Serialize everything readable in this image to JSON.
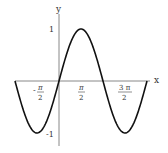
{
  "chart_data": {
    "type": "line",
    "title": "",
    "function": "sin(x)",
    "xlabel": "x",
    "ylabel": "y",
    "xlim": [
      -3.1416,
      6.2832
    ],
    "ylim": [
      -1,
      1
    ],
    "grid": false,
    "legend": null,
    "x_ticks": [
      {
        "value": -1.5708,
        "num": "π",
        "den": "2",
        "sign": "-"
      },
      {
        "value": 1.5708,
        "num": "π",
        "den": "2",
        "sign": ""
      },
      {
        "value": 4.7124,
        "num": "3 π",
        "den": "2",
        "sign": ""
      }
    ],
    "y_ticks": [
      {
        "value": 1,
        "label": "1"
      },
      {
        "value": -1,
        "label": "-1"
      }
    ],
    "series": [
      {
        "name": "sin(x)",
        "x": [
          -3.1416,
          -2.3562,
          -1.5708,
          -0.7854,
          0,
          0.7854,
          1.5708,
          2.3562,
          3.1416,
          3.927,
          4.7124,
          5.4978,
          6.2832
        ],
        "y": [
          0,
          -0.7071,
          -1,
          -0.7071,
          0,
          0.7071,
          1,
          0.7071,
          0,
          -0.7071,
          -1,
          -0.7071,
          0
        ]
      }
    ]
  },
  "axes": {
    "x_label": "x",
    "y_label": "y",
    "tick_1": "1",
    "tick_neg1": "-1",
    "neg_pi_half_sign": "-",
    "neg_pi_half_num": "π",
    "neg_pi_half_den": "2",
    "pi_half_num": "π",
    "pi_half_den": "2",
    "three_pi_half_num": "3 π",
    "three_pi_half_den": "2"
  }
}
